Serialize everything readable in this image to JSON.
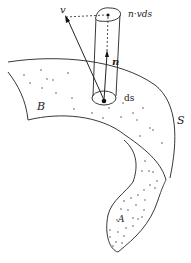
{
  "diagram": {
    "labels": {
      "v": "v",
      "n_v_ds": "n·vds",
      "n": "n",
      "ds": "ds",
      "B": "B",
      "S": "S",
      "A": "A"
    },
    "colors": {
      "stroke": "#222222",
      "background": "#ffffff"
    }
  }
}
